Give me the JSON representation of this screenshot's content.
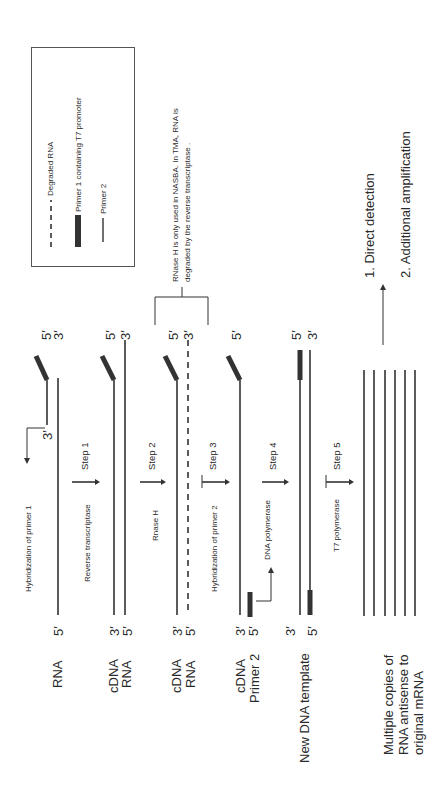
{
  "legend": {
    "items": [
      {
        "symbol": "dashed-line",
        "label": "Degraded RNA"
      },
      {
        "symbol": "thick-bar",
        "label": "Primer 1 containing T7 promoter"
      },
      {
        "symbol": "thin-line",
        "label": "Primer 2"
      }
    ]
  },
  "note": {
    "line1": "RNase H is only used in NASBA.  In TMA, RNA is",
    "line2": "degraded by the reverse transcriptase ."
  },
  "outcomes": {
    "item1": "1.  Direct detection",
    "item2": "2.  Additional  amplification"
  },
  "rows": [
    {
      "labels": [
        "RNA"
      ]
    },
    {
      "labels": [
        "cDNA",
        "RNA"
      ]
    },
    {
      "labels": [
        "cDNA",
        "RNA"
      ]
    },
    {
      "labels": [
        "cDNA",
        "Primer 2"
      ]
    },
    {
      "labels": [
        "New DNA template"
      ]
    },
    {
      "labels": [
        "Multiple copies of",
        "RNA antisense to",
        "original mRNA"
      ]
    }
  ],
  "steps": [
    {
      "step": "Step 1",
      "enzyme": "Reverse transcriptase"
    },
    {
      "step": "Step 2",
      "enzyme": "Rnase H"
    },
    {
      "step": "Step 3",
      "enzyme": "Hybridization of primer 2"
    },
    {
      "step": "Step 4",
      "enzyme": "DNA polymerase"
    },
    {
      "step": "Step 5",
      "enzyme": "T7 polymerase"
    }
  ],
  "annotations": {
    "hybridization_primer1": "Hybridization of primer 1",
    "dna_polymerase_side": "DNA polymerase"
  },
  "ends": {
    "five": "5′",
    "three": "3′"
  }
}
